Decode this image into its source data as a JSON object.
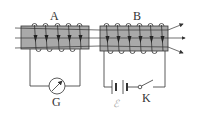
{
  "diagram": {
    "type": "electromagnetic-induction-circuit",
    "coil_a": {
      "label": "A",
      "turns": 5
    },
    "coil_b": {
      "label": "B",
      "turns": 6
    },
    "galvanometer": {
      "label": "G"
    },
    "battery": {
      "label": "ℰ"
    },
    "switch": {
      "label": "K",
      "state": "open"
    },
    "field_lines": {
      "count": 3,
      "direction": "left-to-right"
    },
    "colors": {
      "core_fill": "#a9a9a9",
      "line": "#333333",
      "emf_label": "#aaaaaa"
    }
  }
}
